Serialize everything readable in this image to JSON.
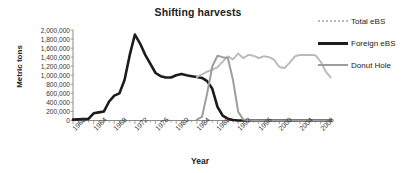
{
  "chart_data": {
    "type": "line",
    "title": "Shifting harvests",
    "xlabel": "Year",
    "ylabel": "Metric tons",
    "xlim": [
      1960,
      2010
    ],
    "ylim": [
      0,
      2000000
    ],
    "grid": false,
    "legend_position": "right",
    "xticks": [
      "1960",
      "1964",
      "1968",
      "1972",
      "1976",
      "1980",
      "1984",
      "1988",
      "1992",
      "1996",
      "2000",
      "2004",
      "2008"
    ],
    "ytick_labels": [
      "2,000,000",
      "1,800,000",
      "1,600,000",
      "1,400,000",
      "1,200,000",
      "1,000,000",
      "800,000",
      "600,000",
      "400,000",
      "200,000",
      "0"
    ],
    "ytick_values": [
      2000000,
      1800000,
      1600000,
      1400000,
      1200000,
      1000000,
      800000,
      600000,
      400000,
      200000,
      0
    ],
    "x": [
      1960,
      1961,
      1962,
      1963,
      1964,
      1965,
      1966,
      1967,
      1968,
      1969,
      1970,
      1971,
      1972,
      1973,
      1974,
      1975,
      1976,
      1977,
      1978,
      1979,
      1980,
      1981,
      1982,
      1983,
      1984,
      1985,
      1986,
      1987,
      1988,
      1989,
      1990,
      1991,
      1992,
      1993,
      1994,
      1995,
      1996,
      1997,
      1998,
      1999,
      2000,
      2001,
      2002,
      2003,
      2004,
      2005,
      2006,
      2007,
      2008,
      2009,
      2010
    ],
    "series": [
      {
        "name": "Foreign eBS",
        "color": "#1c1c1c",
        "style": "solid",
        "width": 2.6,
        "values": [
          20000,
          25000,
          30000,
          35000,
          160000,
          180000,
          200000,
          420000,
          550000,
          600000,
          900000,
          1450000,
          1900000,
          1700000,
          1450000,
          1250000,
          1050000,
          980000,
          950000,
          950000,
          1000000,
          1030000,
          1000000,
          980000,
          960000,
          940000,
          870000,
          700000,
          300000,
          110000,
          40000,
          10000,
          0,
          0,
          0,
          0,
          0,
          0,
          0,
          0,
          0,
          0,
          0,
          0,
          0,
          0,
          0,
          0,
          0,
          0,
          0
        ]
      },
      {
        "name": "Total eBS",
        "color": "#b9b9b9",
        "style": "dotted",
        "width": 2.0,
        "values": [
          null,
          null,
          null,
          null,
          null,
          null,
          null,
          null,
          null,
          null,
          null,
          null,
          null,
          null,
          null,
          null,
          null,
          null,
          null,
          null,
          null,
          null,
          null,
          null,
          960000,
          1020000,
          1080000,
          1120000,
          1180000,
          1300000,
          1420000,
          1350000,
          1480000,
          1380000,
          1450000,
          1430000,
          1380000,
          1420000,
          1400000,
          1340000,
          1180000,
          1160000,
          1280000,
          1420000,
          1450000,
          1450000,
          1450000,
          1440000,
          1300000,
          1080000,
          940000
        ]
      },
      {
        "name": "Donut Hole",
        "color": "#9d9d9d",
        "style": "solid",
        "width": 2.0,
        "values": [
          null,
          null,
          null,
          null,
          null,
          null,
          null,
          null,
          null,
          null,
          null,
          null,
          null,
          null,
          null,
          null,
          null,
          null,
          null,
          null,
          null,
          null,
          null,
          null,
          20000,
          80000,
          600000,
          1200000,
          1430000,
          1400000,
          1380000,
          900000,
          200000,
          20000,
          0,
          0,
          0,
          0,
          0,
          0,
          0,
          0,
          0,
          0,
          0,
          0,
          0,
          0,
          0,
          0,
          0
        ]
      }
    ]
  },
  "legend": {
    "items": [
      {
        "label": "Total eBS"
      },
      {
        "label": "Foreign eBS"
      },
      {
        "label": "Donut Hole"
      }
    ]
  }
}
